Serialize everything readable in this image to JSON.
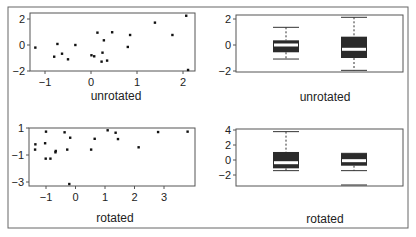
{
  "chart_data": [
    {
      "type": "scatter",
      "panel": "top-left",
      "xlabel": "unrotated",
      "ylabel": "",
      "xlim": [
        -1.35,
        2.25
      ],
      "ylim": [
        -2.1,
        2.4
      ],
      "xticks": [
        -1,
        0,
        1,
        2
      ],
      "yticks": [
        -2,
        0,
        2
      ],
      "grid": false,
      "points": [
        [
          -1.21,
          -0.2
        ],
        [
          -0.73,
          0.08
        ],
        [
          -0.8,
          -0.9
        ],
        [
          -0.63,
          -0.67
        ],
        [
          -0.5,
          -1.1
        ],
        [
          -0.34,
          0.0
        ],
        [
          0.01,
          -0.79
        ],
        [
          0.07,
          -0.87
        ],
        [
          0.14,
          0.95
        ],
        [
          0.28,
          0.36
        ],
        [
          0.25,
          -0.59
        ],
        [
          0.23,
          -1.28
        ],
        [
          0.35,
          -1.2
        ],
        [
          0.46,
          0.98
        ],
        [
          0.8,
          -0.15
        ],
        [
          0.85,
          0.77
        ],
        [
          1.39,
          1.72
        ],
        [
          1.77,
          0.77
        ],
        [
          2.07,
          2.25
        ],
        [
          2.11,
          -1.92
        ]
      ]
    },
    {
      "type": "boxplot",
      "panel": "top-right",
      "xlabel": "unrotated",
      "ylim": [
        -2.1,
        2.4
      ],
      "yticks": [
        -2,
        0,
        2
      ],
      "boxes": [
        {
          "name": "x",
          "whisker_low": -1.08,
          "q1": -0.56,
          "median": 0.0,
          "q3": 0.36,
          "whisker_high": 1.36
        },
        {
          "name": "y",
          "whisker_low": -1.95,
          "q1": -1.0,
          "median": -0.33,
          "q3": 0.64,
          "whisker_high": 2.13
        }
      ]
    },
    {
      "type": "scatter",
      "panel": "bottom-left",
      "xlabel": "rotated",
      "xlim": [
        -1.55,
        4.0
      ],
      "ylim": [
        -3.3,
        1.0
      ],
      "xticks": [
        -1,
        0,
        1,
        2,
        3
      ],
      "yticks": [
        -3,
        -1,
        1
      ],
      "grid": false,
      "points": [
        [
          -1.0,
          0.73
        ],
        [
          -1.36,
          -0.21
        ],
        [
          -1.37,
          -0.6
        ],
        [
          -1.03,
          -0.13
        ],
        [
          -1.01,
          -1.27
        ],
        [
          -0.85,
          -1.27
        ],
        [
          -0.67,
          -0.7
        ],
        [
          -0.68,
          -0.8
        ],
        [
          -0.37,
          0.68
        ],
        [
          -0.28,
          -0.6
        ],
        [
          -0.18,
          0.28
        ],
        [
          -0.21,
          -3.15
        ],
        [
          0.53,
          -0.6
        ],
        [
          0.65,
          0.2
        ],
        [
          1.09,
          0.83
        ],
        [
          1.36,
          0.65
        ],
        [
          1.44,
          0.18
        ],
        [
          2.14,
          -0.43
        ],
        [
          2.8,
          0.7
        ],
        [
          3.8,
          0.73
        ]
      ]
    },
    {
      "type": "boxplot",
      "panel": "bottom-right",
      "xlabel": "rotated",
      "ylim": [
        -3.5,
        4.1
      ],
      "yticks": [
        -2,
        0,
        2,
        4
      ],
      "boxes": [
        {
          "name": "x",
          "whisker_low": -1.42,
          "q1": -1.11,
          "median": -0.36,
          "q3": 1.07,
          "whisker_high": 3.78
        },
        {
          "name": "y",
          "whisker_low": -1.42,
          "q1": -0.76,
          "median": -0.09,
          "q3": 0.89,
          "whisker_high": 0.89,
          "outlier_line": -3.33
        }
      ]
    }
  ],
  "labels": {
    "tl": "unrotated",
    "tr": "unrotated",
    "bl": "rotated",
    "br": "rotated"
  },
  "colors": {
    "axis": "#555555",
    "point": "#111111",
    "box_fill": "#2b2b2b",
    "median": "#ffffff"
  }
}
